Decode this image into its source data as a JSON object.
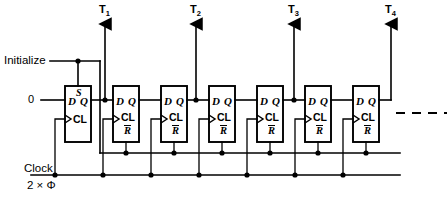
{
  "diagram": {
    "inputs": {
      "initialize_label": "Initialize",
      "data_zero_label": "0",
      "clock_label": "Clock",
      "clock_rate_label": "2 × Φ"
    },
    "outputs": [
      {
        "name": "T1",
        "base": "T",
        "sub": "1"
      },
      {
        "name": "T2",
        "base": "T",
        "sub": "2"
      },
      {
        "name": "T3",
        "base": "T",
        "sub": "3"
      },
      {
        "name": "T4",
        "base": "T",
        "sub": "4"
      }
    ],
    "flipflops": [
      {
        "id": "ff1",
        "d": "D",
        "q": "Q",
        "clock": "CL",
        "set": "S",
        "reset": null
      },
      {
        "id": "ff2",
        "d": "D",
        "q": "Q",
        "clock": "CL",
        "set": null,
        "reset": "R"
      },
      {
        "id": "ff3",
        "d": "D",
        "q": "Q",
        "clock": "CL",
        "set": null,
        "reset": "R"
      },
      {
        "id": "ff4",
        "d": "D",
        "q": "Q",
        "clock": "CL",
        "set": null,
        "reset": "R"
      },
      {
        "id": "ff5",
        "d": "D",
        "q": "Q",
        "clock": "CL",
        "set": null,
        "reset": "R"
      },
      {
        "id": "ff6",
        "d": "D",
        "q": "Q",
        "clock": "CL",
        "set": null,
        "reset": "R"
      },
      {
        "id": "ff7",
        "d": "D",
        "q": "Q",
        "clock": "CL",
        "set": null,
        "reset": "R"
      }
    ],
    "continuation": "dashed-line-right",
    "colors": {
      "line": "#000000",
      "background": "#ffffff"
    }
  }
}
